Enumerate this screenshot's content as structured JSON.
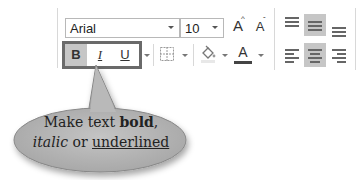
{
  "font_group": {
    "font_name": "Arial",
    "font_size": "10",
    "grow_font_label": "A",
    "shrink_font_label": "A",
    "bold_label": "B",
    "italic_label": "I",
    "underline_label": "U",
    "font_color_label": "A"
  },
  "alignment_group": {
    "top_align": "top-align-icon",
    "middle_align": "middle-align-icon",
    "bottom_align": "bottom-align-icon",
    "align_left": "align-left-icon",
    "align_center": "align-center-icon",
    "align_right": "align-right-icon",
    "active": [
      "middle_align",
      "align_center"
    ]
  },
  "callout": {
    "line1_prefix": "Make text ",
    "bold_word": "bold",
    "line1_suffix": ",",
    "italic_word": "italic",
    "middle_word": " or ",
    "underlined_word": "underlined"
  },
  "colors": {
    "highlight": "#c6c6c6",
    "frame": "#6a6a6a",
    "callout_fill": "#b5b5b5"
  }
}
